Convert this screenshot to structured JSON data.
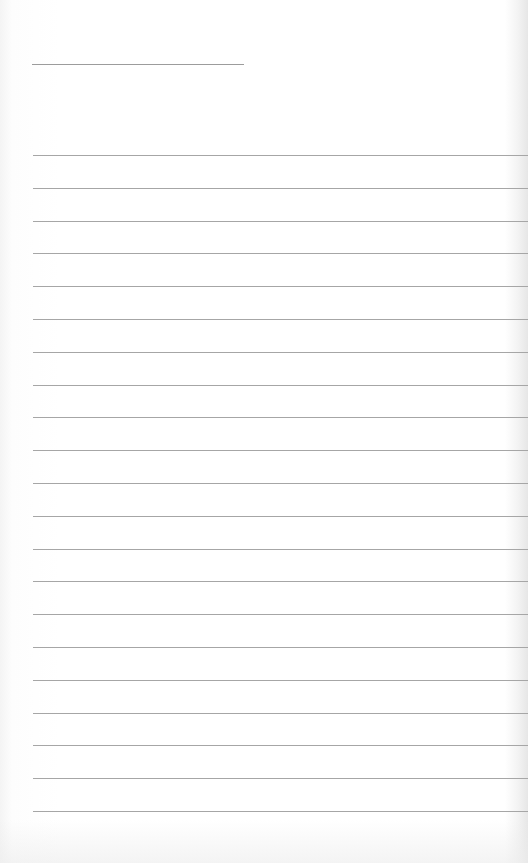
{
  "page": {
    "type": "lined-notebook-sheet",
    "background_color": "#fdfdfd",
    "line_color": "#a6a6a6",
    "header_line": {
      "x": 32,
      "y": 64,
      "width": 212
    },
    "ruled_lines": {
      "count": 21,
      "start_y": 155,
      "spacing": 32.8,
      "x": 33,
      "width": 495
    }
  }
}
